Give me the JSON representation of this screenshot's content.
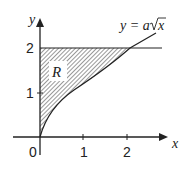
{
  "diagram": {
    "curve_label_prefix": "y = a",
    "curve_label_radicand": "x",
    "region_label": "R",
    "axes": {
      "x_label": "x",
      "y_label": "y",
      "origin_label": "0",
      "x_ticks": [
        "1",
        "2"
      ],
      "y_ticks": [
        "1",
        "2"
      ]
    },
    "horizontal_line": "y = 2",
    "intersection_x_approx": 2.1,
    "colors": {
      "stroke": "#222222",
      "background": "#ffffff",
      "hatch": "#333333"
    }
  }
}
